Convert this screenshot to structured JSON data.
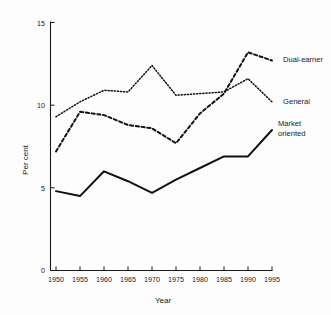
{
  "chart_data": {
    "type": "line",
    "title": "",
    "xlabel": "Year",
    "ylabel": "Per cent",
    "x": [
      1950,
      1955,
      1960,
      1965,
      1970,
      1975,
      1980,
      1985,
      1990,
      1995
    ],
    "xticks": [
      "1950",
      "1955",
      "1960",
      "1965",
      "1970",
      "1975",
      "1980",
      "1985",
      "1990",
      "1995"
    ],
    "yticks": [
      "0",
      "5",
      "10",
      "15"
    ],
    "ytick_values": [
      0,
      5,
      10,
      15
    ],
    "xlim": [
      1950,
      1995
    ],
    "ylim": [
      0,
      15
    ],
    "grid": false,
    "legend_position": "right-inline-labels",
    "series": [
      {
        "name": "Dual-earner",
        "style": "dashed",
        "label": "Dual-earner",
        "values": [
          7.2,
          9.6,
          9.4,
          8.8,
          8.6,
          7.7,
          9.5,
          10.7,
          13.2,
          12.7
        ]
      },
      {
        "name": "General",
        "style": "dotted",
        "label": "General",
        "values": [
          9.3,
          10.2,
          10.9,
          10.8,
          12.4,
          10.6,
          10.7,
          10.8,
          11.6,
          10.2
        ]
      },
      {
        "name": "Market oriented",
        "style": "solid",
        "label": "Market oriented",
        "label_line1": "Market",
        "label_line2": "oriented",
        "values": [
          4.8,
          4.5,
          6.0,
          5.4,
          4.7,
          5.5,
          6.2,
          6.9,
          6.9,
          8.5
        ]
      }
    ],
    "colors": {
      "axis": "#1a1a1a",
      "line": "#111111",
      "background": "#fdfdfd"
    }
  }
}
